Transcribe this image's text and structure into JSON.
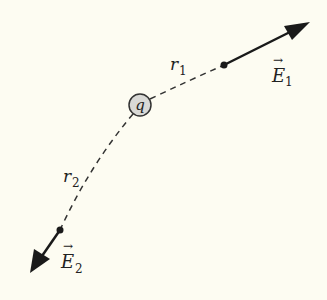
{
  "diagram": {
    "charge": {
      "label": "q",
      "fill": "#d9d9d6",
      "stroke": "#333333"
    },
    "paths": [
      {
        "label_main": "r",
        "label_sub": "1"
      },
      {
        "label_main": "r",
        "label_sub": "2"
      }
    ],
    "vectors": [
      {
        "label_main": "E",
        "label_sub": "1",
        "arrow": "→"
      },
      {
        "label_main": "E",
        "label_sub": "2",
        "arrow": "→"
      }
    ],
    "colors": {
      "background": "#fdfcf2",
      "ink": "#1a1a1a"
    }
  }
}
